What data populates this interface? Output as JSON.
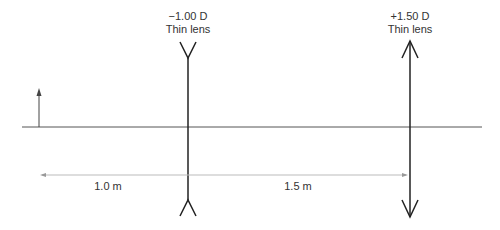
{
  "lenses": [
    {
      "power": "−1.00 D",
      "type": "Thin lens",
      "kind": "diverging"
    },
    {
      "power": "+1.50 D",
      "type": "Thin lens",
      "kind": "converging"
    }
  ],
  "distances": [
    {
      "label": "1.0 m"
    },
    {
      "label": "1.5 m"
    }
  ],
  "colors": {
    "axis": "#555555",
    "lens": "#222222",
    "dimension": "#bbbbbb"
  }
}
